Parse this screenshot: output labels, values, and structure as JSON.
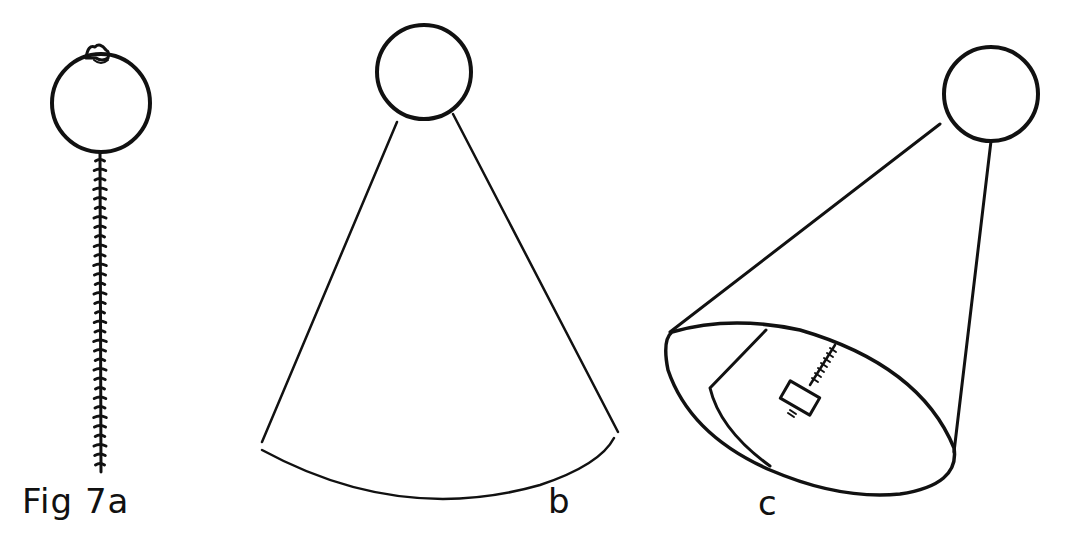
{
  "figure": {
    "title": "Fig 7a",
    "panels": [
      {
        "id": "a",
        "label": "Fig 7a",
        "description": "circle with stitched seam line descending from bottom, small knot at top"
      },
      {
        "id": "b",
        "label": "b",
        "description": "circle at apex of cone shape with curved base"
      },
      {
        "id": "c",
        "label": "c",
        "description": "circle at apex of tilted cone with elliptical opening containing fold and small rectangle with stitched line"
      }
    ]
  },
  "colors": {
    "ink": "#111111",
    "background": "#ffffff"
  }
}
